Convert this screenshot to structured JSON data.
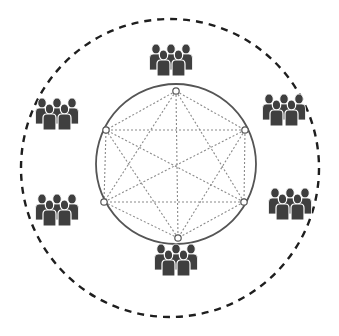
{
  "diagram": {
    "type": "network-topology",
    "colors": {
      "background": "#ffffff",
      "outer_boundary": "#1e1e1e",
      "ring": "#555555",
      "mesh_lines": "#8a8a8a",
      "node_fill": "#ffffff",
      "node_stroke": "#555555",
      "people": "#3f3f3f"
    },
    "outer_boundary": {
      "cx": 170,
      "cy": 168,
      "r": 149,
      "style": "dashed"
    },
    "ring": {
      "cx": 176,
      "cy": 164,
      "r": 80
    },
    "nodes": [
      {
        "id": "top",
        "x": 176,
        "y": 91
      },
      {
        "id": "upper-right",
        "x": 245,
        "y": 130
      },
      {
        "id": "lower-right",
        "x": 244,
        "y": 202
      },
      {
        "id": "bottom",
        "x": 178,
        "y": 238
      },
      {
        "id": "lower-left",
        "x": 104,
        "y": 202
      },
      {
        "id": "upper-left",
        "x": 106,
        "y": 130
      }
    ],
    "mesh": "all-pairs",
    "groups": [
      {
        "id": "top",
        "x": 171,
        "y": 62,
        "people": 5
      },
      {
        "id": "upper-left",
        "x": 57,
        "y": 116,
        "people": 5
      },
      {
        "id": "upper-right",
        "x": 284,
        "y": 112,
        "people": 5
      },
      {
        "id": "lower-left",
        "x": 57,
        "y": 212,
        "people": 5
      },
      {
        "id": "lower-right",
        "x": 290,
        "y": 206,
        "people": 5
      },
      {
        "id": "bottom",
        "x": 176,
        "y": 262,
        "people": 5
      }
    ]
  }
}
